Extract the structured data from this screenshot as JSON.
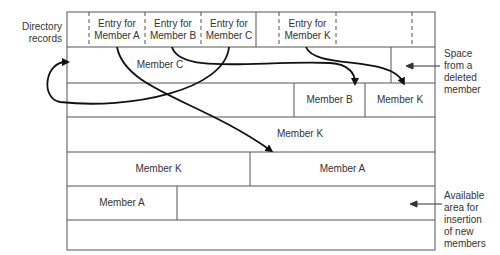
{
  "labels": {
    "directory_records": [
      "Directory",
      "records"
    ],
    "space_deleted": [
      "Space",
      "from a",
      "deleted",
      "member"
    ],
    "available_area": [
      "Available",
      "area for",
      "insertion",
      "of new",
      "members"
    ]
  },
  "directory": {
    "entries": [
      {
        "line1": "Entry for",
        "line2": "Member A"
      },
      {
        "line1": "Entry for",
        "line2": "Member B"
      },
      {
        "line1": "Entry for",
        "line2": "Member C"
      },
      {
        "line1": "Entry for",
        "line2": "Member K"
      }
    ]
  },
  "rows": {
    "row1": {
      "member_c": "Member C"
    },
    "row2": {
      "member_b": "Member B",
      "member_k": "Member K"
    },
    "row3": {
      "member_k": "Member K"
    },
    "row4": {
      "member_k": "Member K",
      "member_a": "Member A"
    },
    "row5": {
      "member_a": "Member A"
    }
  }
}
